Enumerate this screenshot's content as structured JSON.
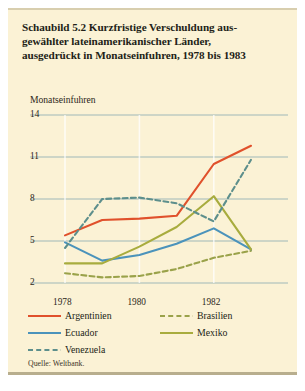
{
  "figure": {
    "title_lines": [
      "Schaubild 5.2   Kurzfristige Verschuldung aus-",
      "gewählter lateinamerikanischer Länder,",
      "ausgedrückt in Monatseinfuhren, 1978 bis 1983"
    ],
    "axis_title": "Monatseinfuhren",
    "source": "Quelle: Weltbank.",
    "background_color": "#fbf2d5",
    "grid_color": "#8fb0b4"
  },
  "chart_data": {
    "type": "line",
    "xlabel": "",
    "ylabel": "Monatseinfuhren",
    "x": [
      1978,
      1979,
      1980,
      1981,
      1982,
      1983
    ],
    "xlim": [
      1978,
      1983
    ],
    "ylim": [
      2,
      14
    ],
    "yticks": [
      2,
      5,
      8,
      11,
      14
    ],
    "ytick_labels": [
      "2",
      "5",
      "8",
      "11",
      "14"
    ],
    "xticks": [
      1978,
      1980,
      1982
    ],
    "xtick_labels": [
      "1978",
      "1980",
      "1982"
    ],
    "grid": true,
    "legend_position": "below",
    "series": [
      {
        "name": "Argentinien",
        "color": "#e0512c",
        "style": "solid",
        "values": [
          5.4,
          6.5,
          6.6,
          6.8,
          10.5,
          11.8
        ]
      },
      {
        "name": "Brasilien",
        "color": "#9aa24a",
        "style": "dashed",
        "values": [
          2.7,
          2.4,
          2.5,
          3.0,
          3.8,
          4.3
        ]
      },
      {
        "name": "Ecuador",
        "color": "#4b93bb",
        "style": "solid",
        "values": [
          4.9,
          3.6,
          4.0,
          4.8,
          5.9,
          4.4
        ]
      },
      {
        "name": "Mexiko",
        "color": "#a8ac3e",
        "style": "solid",
        "values": [
          3.4,
          3.4,
          4.6,
          6.0,
          8.2,
          4.4
        ]
      },
      {
        "name": "Venezuela",
        "color": "#5d8f8c",
        "style": "dashed",
        "values": [
          4.5,
          8.0,
          8.1,
          7.7,
          6.4,
          10.8
        ]
      }
    ]
  },
  "legend": {
    "items": [
      {
        "label": "Argentinien",
        "color": "#e0512c",
        "style": "solid"
      },
      {
        "label": "Brasilien",
        "color": "#9aa24a",
        "style": "dashed"
      },
      {
        "label": "Ecuador",
        "color": "#4b93bb",
        "style": "solid"
      },
      {
        "label": "Mexiko",
        "color": "#a8ac3e",
        "style": "solid"
      },
      {
        "label": "Venezuela",
        "color": "#5d8f8c",
        "style": "dashed"
      }
    ]
  }
}
